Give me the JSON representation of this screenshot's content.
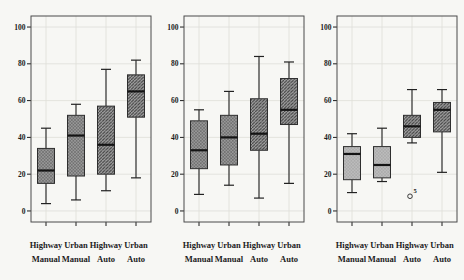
{
  "figure": {
    "background": "#f7f7f4",
    "panel_fill": "#f7f7f4",
    "border_color": "#4b4b4b",
    "grid_color": "#deded8",
    "text_color": "#1c1c1c",
    "whisker_color": "#222222",
    "box_edge_color": "#2e2e2e",
    "median_color": "#141414",
    "outlier_color": "#3a3a3a",
    "patterns": {
      "cross": {
        "base": "#999999",
        "line": "#5f5f5f"
      },
      "diag": {
        "base": "#a1a1a1",
        "line": "#3e3e3e"
      },
      "dots": {
        "base": "#bcbcbc",
        "line": "#8c8c8c"
      }
    }
  },
  "chart_data": [
    {
      "type": "boxplot",
      "title": "",
      "xlabel": "",
      "ylabel": "",
      "ylim": [
        -6,
        106
      ],
      "yticks": [
        0,
        20,
        40,
        60,
        80,
        100
      ],
      "grid": true,
      "categories_row1": [
        "Highway",
        "Urban",
        "Highway",
        "Urban"
      ],
      "categories_row2": [
        "Manual",
        "Manual",
        "Auto",
        "Auto"
      ],
      "boxes": [
        {
          "whisker_low": 4,
          "q1": 15,
          "median": 22,
          "q3": 34,
          "whisker_high": 45,
          "pattern": "cross"
        },
        {
          "whisker_low": 6,
          "q1": 19,
          "median": 41,
          "q3": 52,
          "whisker_high": 58,
          "pattern": "cross"
        },
        {
          "whisker_low": 11,
          "q1": 20,
          "median": 36,
          "q3": 57,
          "whisker_high": 77,
          "pattern": "diag"
        },
        {
          "whisker_low": 18,
          "q1": 51,
          "median": 65,
          "q3": 74,
          "whisker_high": 82,
          "pattern": "diag"
        }
      ],
      "outliers": []
    },
    {
      "type": "boxplot",
      "title": "",
      "xlabel": "",
      "ylabel": "",
      "ylim": [
        -6,
        106
      ],
      "yticks": [
        0,
        20,
        40,
        60,
        80,
        100
      ],
      "grid": true,
      "categories_row1": [
        "Highway",
        "Urban",
        "Highway",
        "Urban"
      ],
      "categories_row2": [
        "Manual",
        "Manual",
        "Auto",
        "Auto"
      ],
      "boxes": [
        {
          "whisker_low": 9,
          "q1": 23,
          "median": 33,
          "q3": 49,
          "whisker_high": 55,
          "pattern": "cross"
        },
        {
          "whisker_low": 14,
          "q1": 25,
          "median": 40,
          "q3": 52,
          "whisker_high": 65,
          "pattern": "cross"
        },
        {
          "whisker_low": 7,
          "q1": 33,
          "median": 42,
          "q3": 61,
          "whisker_high": 84,
          "pattern": "diag"
        },
        {
          "whisker_low": 15,
          "q1": 47,
          "median": 55,
          "q3": 72,
          "whisker_high": 81,
          "pattern": "diag"
        }
      ],
      "outliers": []
    },
    {
      "type": "boxplot",
      "title": "",
      "xlabel": "",
      "ylabel": "",
      "ylim": [
        -6,
        106
      ],
      "yticks": [
        0,
        20,
        40,
        60,
        80,
        100
      ],
      "grid": true,
      "categories_row1": [
        "Highway",
        "Urban",
        "Highway",
        "Urban"
      ],
      "categories_row2": [
        "Manual",
        "Manual",
        "Auto",
        "Auto"
      ],
      "boxes": [
        {
          "whisker_low": 10,
          "q1": 17,
          "median": 31,
          "q3": 35,
          "whisker_high": 42,
          "pattern": "dots"
        },
        {
          "whisker_low": 16,
          "q1": 18,
          "median": 25,
          "q3": 35,
          "whisker_high": 45,
          "pattern": "dots"
        },
        {
          "whisker_low": 37,
          "q1": 40,
          "median": 46,
          "q3": 52,
          "whisker_high": 66,
          "pattern": "diag"
        },
        {
          "whisker_low": 21,
          "q1": 43,
          "median": 55,
          "q3": 59,
          "whisker_high": 66,
          "pattern": "diag"
        }
      ],
      "outliers": [
        {
          "box_index": 2,
          "value": 8,
          "label": "5"
        }
      ]
    }
  ]
}
